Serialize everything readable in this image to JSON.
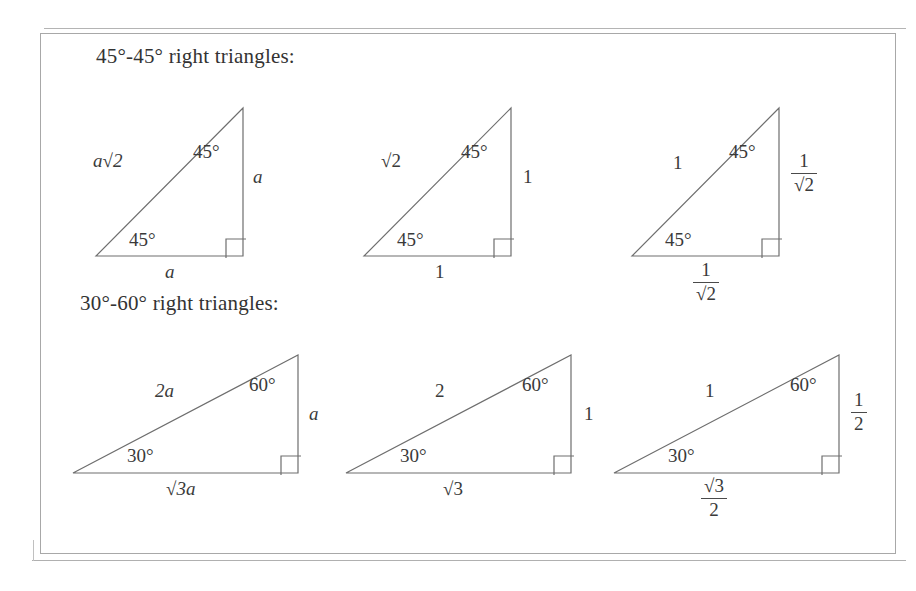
{
  "page": {
    "background_color": "#ffffff",
    "ink_color": "#3a3a3a",
    "rule_color": "#a8a8a8"
  },
  "sections": [
    {
      "id": "right-triangles-45-45",
      "heading": "45°-45° right triangles:",
      "triangles": [
        {
          "id": "tri-45-a",
          "hypotenuse": "a√2",
          "vertical_leg": "a",
          "horizontal_leg": "a",
          "angle_top": "45°",
          "angle_bottom_left": "45°",
          "right_angle_marker": true
        },
        {
          "id": "tri-45-unit",
          "hypotenuse": "√2",
          "vertical_leg": "1",
          "horizontal_leg": "1",
          "angle_top": "45°",
          "angle_bottom_left": "45°",
          "right_angle_marker": true
        },
        {
          "id": "tri-45-normalized",
          "hypotenuse": "1",
          "vertical_leg_numerator": "1",
          "vertical_leg_denominator": "√2",
          "horizontal_leg_numerator": "1",
          "horizontal_leg_denominator": "√2",
          "angle_top": "45°",
          "angle_bottom_left": "45°",
          "right_angle_marker": true
        }
      ]
    },
    {
      "id": "right-triangles-30-60",
      "heading": "30°-60° right triangles:",
      "triangles": [
        {
          "id": "tri-3060-a",
          "hypotenuse": "2a",
          "vertical_leg": "a",
          "horizontal_leg": "√3a",
          "angle_top": "60°",
          "angle_bottom_left": "30°",
          "right_angle_marker": true
        },
        {
          "id": "tri-3060-unit",
          "hypotenuse": "2",
          "vertical_leg": "1",
          "horizontal_leg": "√3",
          "angle_top": "60°",
          "angle_bottom_left": "30°",
          "right_angle_marker": true
        },
        {
          "id": "tri-3060-normalized",
          "hypotenuse": "1",
          "vertical_leg_numerator": "1",
          "vertical_leg_denominator": "2",
          "horizontal_leg_numerator": "√3",
          "horizontal_leg_denominator": "2",
          "angle_top": "60°",
          "angle_bottom_left": "30°",
          "right_angle_marker": true
        }
      ]
    }
  ]
}
